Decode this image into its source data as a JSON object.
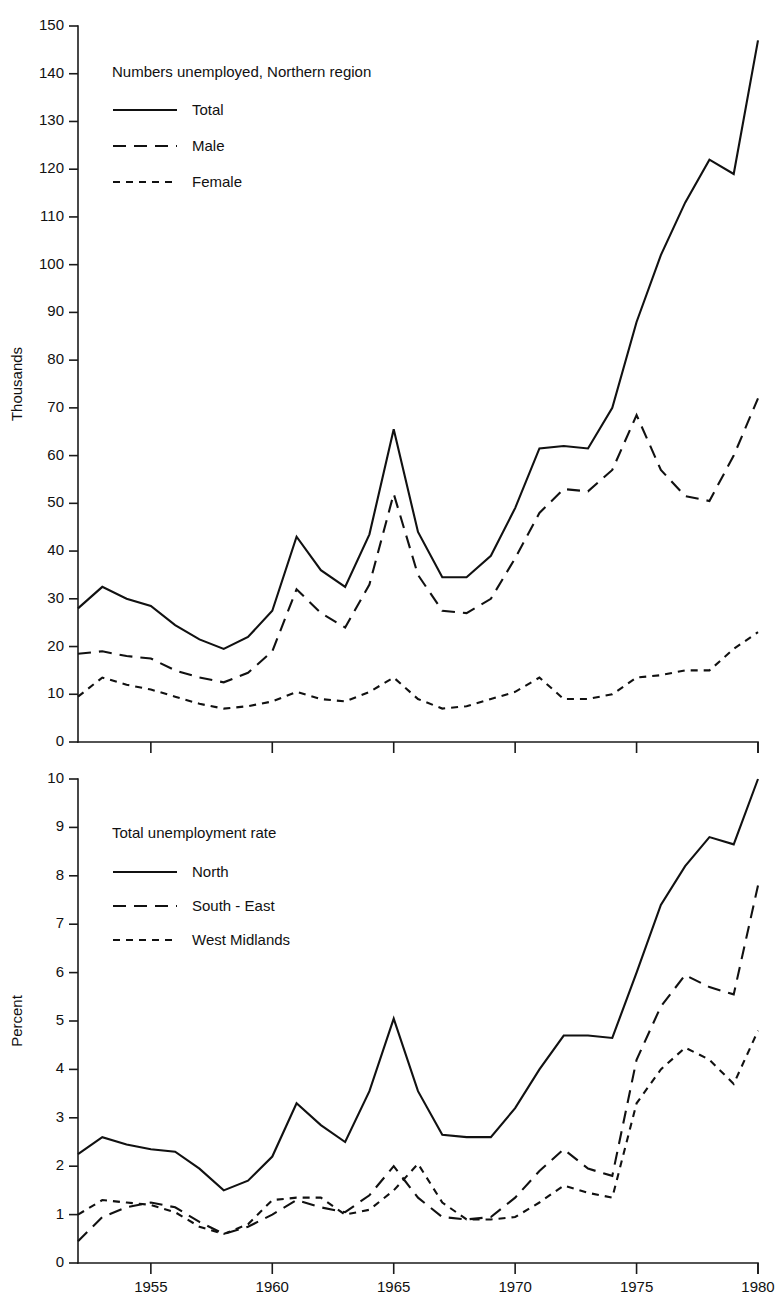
{
  "chart_data": [
    {
      "type": "line",
      "title": "Numbers unemployed, Northern region",
      "xlabel": "",
      "ylabel": "Thousands",
      "xlim": [
        1952,
        1980
      ],
      "ylim": [
        0,
        150
      ],
      "ytick_step": 10,
      "yticks": [
        0,
        10,
        20,
        30,
        40,
        50,
        60,
        70,
        80,
        90,
        100,
        110,
        120,
        130,
        140,
        150
      ],
      "xticks": [
        1955,
        1960,
        1965,
        1970,
        1975,
        1980
      ],
      "xtick_labels_visible": false,
      "grid": false,
      "legend_position": "upper-left-inside",
      "x": [
        1952,
        1953,
        1954,
        1955,
        1956,
        1957,
        1958,
        1959,
        1960,
        1961,
        1962,
        1963,
        1964,
        1965,
        1966,
        1967,
        1968,
        1969,
        1970,
        1971,
        1972,
        1973,
        1974,
        1975,
        1976,
        1977,
        1978,
        1979,
        1980
      ],
      "series": [
        {
          "name": "Total",
          "style": "solid",
          "values": [
            28.0,
            32.5,
            30.0,
            28.5,
            24.5,
            21.5,
            19.5,
            22.0,
            27.5,
            43.0,
            36.0,
            32.5,
            43.5,
            65.5,
            44.0,
            34.5,
            34.5,
            39.0,
            49.0,
            61.5,
            62.0,
            61.5,
            70.0,
            82.0,
            71.0,
            66.5,
            65.5,
            79.5,
            95.0
          ]
        },
        {
          "name": "Male",
          "style": "dashed-long",
          "values": [
            18.5,
            19.0,
            18.0,
            17.5,
            15.0,
            13.5,
            12.5,
            14.5,
            19.0,
            32.0,
            27.0,
            24.0,
            33.0,
            52.0,
            35.0,
            27.5,
            27.0,
            30.0,
            38.5,
            48.0,
            53.0,
            52.5,
            57.0,
            68.5,
            57.0,
            51.5,
            50.5,
            60.0,
            72.0
          ]
        },
        {
          "name": "Female",
          "style": "dashed-short",
          "values": [
            9.5,
            13.5,
            12.0,
            11.0,
            9.5,
            8.0,
            7.0,
            7.5,
            8.5,
            10.5,
            9.0,
            8.5,
            10.5,
            13.5,
            9.0,
            7.0,
            7.5,
            9.0,
            10.5,
            13.5,
            9.0,
            9.0,
            10.0,
            13.5,
            14.0,
            15.0,
            15.0,
            19.5,
            23.0
          ]
        }
      ],
      "series_full_values_note": "",
      "total_values_right": [
        88.0,
        102.0,
        113.0,
        122.0,
        119.0,
        147.0
      ],
      "legend_entries": [
        "Total",
        "Male",
        "Female"
      ]
    },
    {
      "type": "line",
      "title": "Total unemployment rate",
      "xlabel": "",
      "ylabel": "Percent",
      "xlim": [
        1952,
        1980
      ],
      "ylim": [
        0,
        10
      ],
      "ytick_step": 1,
      "yticks": [
        0,
        1,
        2,
        3,
        4,
        5,
        6,
        7,
        8,
        9,
        10
      ],
      "xticks": [
        1955,
        1960,
        1965,
        1970,
        1975,
        1980
      ],
      "xtick_labels": [
        "1955",
        "1960",
        "1965",
        "1970",
        "1975",
        "1980"
      ],
      "xtick_labels_visible": true,
      "grid": false,
      "legend_position": "upper-left-inside",
      "x": [
        1952,
        1953,
        1954,
        1955,
        1956,
        1957,
        1958,
        1959,
        1960,
        1961,
        1962,
        1963,
        1964,
        1965,
        1966,
        1967,
        1968,
        1969,
        1970,
        1971,
        1972,
        1973,
        1974,
        1975,
        1976,
        1977,
        1978,
        1979,
        1980
      ],
      "series": [
        {
          "name": "North",
          "style": "solid",
          "values": [
            2.25,
            2.6,
            2.45,
            2.35,
            2.3,
            1.95,
            1.5,
            1.7,
            2.2,
            3.3,
            2.85,
            2.5,
            3.55,
            5.05,
            3.55,
            2.65,
            2.6,
            2.6,
            3.2,
            4.0,
            4.7,
            4.7,
            4.65,
            5.55,
            6.4,
            5.4,
            4.75,
            4.65,
            5.6
          ]
        },
        {
          "name": "South - East",
          "style": "dashed-long",
          "values": [
            0.45,
            0.95,
            1.15,
            1.25,
            1.15,
            0.85,
            0.6,
            0.75,
            1.0,
            1.3,
            1.15,
            1.05,
            1.4,
            2.0,
            1.35,
            0.95,
            0.9,
            0.95,
            1.35,
            1.9,
            2.35,
            1.95,
            1.8,
            1.65,
            2.1,
            2.9,
            3.6,
            2.55,
            2.2
          ]
        },
        {
          "name": "West Midlands",
          "style": "dashed-short",
          "values": [
            1.0,
            1.3,
            1.25,
            1.2,
            1.05,
            0.75,
            0.6,
            0.8,
            1.3,
            1.35,
            1.35,
            1.0,
            1.1,
            1.5,
            2.05,
            1.25,
            0.9,
            0.9,
            0.95,
            1.25,
            1.6,
            1.45,
            1.35,
            1.5,
            1.75,
            1.55,
            1.6,
            1.85,
            2.2
          ]
        }
      ],
      "north_values_right": [
        6.0,
        7.4,
        8.2,
        8.8,
        8.65,
        10.0
      ],
      "south_east_values_right": [
        4.2,
        5.3,
        5.95,
        5.7,
        5.55,
        7.8
      ],
      "west_midlands_values_right": [
        3.3,
        4.0,
        4.45,
        4.2,
        3.7,
        4.8
      ],
      "legend_entries": [
        "North",
        "South - East",
        "West Midlands"
      ]
    }
  ],
  "top_chart": {
    "legend_title": "Numbers unemployed, Northern region",
    "ylabel": "Thousands",
    "legend": [
      {
        "label": "Total",
        "style": "solid"
      },
      {
        "label": "Male",
        "style": "dashed-long"
      },
      {
        "label": "Female",
        "style": "dashed-short"
      }
    ],
    "ytick_labels": [
      "150",
      "140",
      "130",
      "120",
      "110",
      "100",
      "90",
      "80",
      "70",
      "60",
      "50",
      "40",
      "30",
      "20",
      "10",
      "0"
    ]
  },
  "bottom_chart": {
    "legend_title": "Total unemployment rate",
    "ylabel": "Percent",
    "legend": [
      {
        "label": "North",
        "style": "solid"
      },
      {
        "label": "South - East",
        "style": "dashed-long"
      },
      {
        "label": "West Midlands",
        "style": "dashed-short"
      }
    ],
    "ytick_labels": [
      "10",
      "9",
      "8",
      "7",
      "6",
      "5",
      "4",
      "3",
      "2",
      "1",
      "0"
    ],
    "xtick_labels": [
      "1955",
      "1960",
      "1965",
      "1970",
      "1975",
      "1980"
    ]
  },
  "colors": {
    "ink": "#111111",
    "background": "#ffffff"
  }
}
